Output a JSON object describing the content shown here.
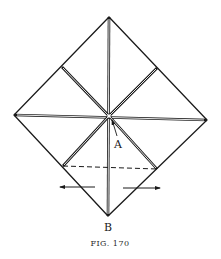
{
  "figure": {
    "caption": "FIG. 170",
    "labels": {
      "A": "A",
      "B": "B"
    },
    "colors": {
      "ink": "#1a1a1a",
      "paper": "#ffffff"
    },
    "square": {
      "top": [
        109,
        17
      ],
      "right": [
        207,
        120
      ],
      "bottom": [
        108,
        216
      ],
      "left": [
        14,
        115
      ],
      "center": [
        109,
        116
      ]
    },
    "creases": {
      "style": "double-line",
      "lines": [
        {
          "name": "vertical",
          "from": [
            109,
            17
          ],
          "to": [
            108,
            216
          ]
        },
        {
          "name": "horizontal",
          "from": [
            14,
            115
          ],
          "to": [
            207,
            120
          ]
        },
        {
          "name": "diag-upper-left",
          "from": [
            62,
            67
          ],
          "to": [
            109,
            116
          ]
        },
        {
          "name": "diag-upper-right",
          "from": [
            157,
            68
          ],
          "to": [
            109,
            116
          ]
        },
        {
          "name": "diag-lower-left",
          "from": [
            63,
            166
          ],
          "to": [
            109,
            116
          ]
        },
        {
          "name": "diag-lower-right",
          "from": [
            157,
            169
          ],
          "to": [
            109,
            116
          ]
        }
      ]
    },
    "fold_line": {
      "style": "dashed",
      "from": [
        63,
        166
      ],
      "to": [
        157,
        169
      ]
    },
    "arrows": [
      {
        "name": "left-arrow",
        "direction": "left",
        "from": [
          95,
          187
        ],
        "to": [
          60,
          187
        ]
      },
      {
        "name": "right-arrow",
        "direction": "right",
        "from": [
          123,
          188
        ],
        "to": [
          160,
          188
        ]
      }
    ]
  }
}
